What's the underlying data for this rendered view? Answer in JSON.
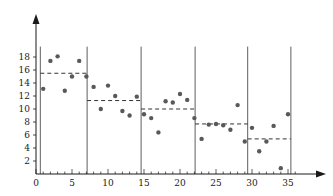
{
  "chart_data": {
    "type": "scatter",
    "title": "",
    "subtitle": "",
    "xlabel": "",
    "ylabel": "",
    "xlim": [
      0,
      36.5
    ],
    "ylim": [
      0,
      19.5
    ],
    "xticks": [
      0,
      5,
      10,
      15,
      20,
      25,
      30,
      35
    ],
    "yticks": [
      2,
      4,
      6,
      8,
      10,
      12,
      14,
      16,
      18
    ],
    "xticklabels": [
      "0",
      "5",
      "10",
      "15",
      "20",
      "25",
      "30",
      "35"
    ],
    "yticklabels": [
      "2",
      "4",
      "6",
      "8",
      "10",
      "12",
      "14",
      "16",
      "18"
    ],
    "grid": false,
    "legend": null,
    "axis_style": "arrow",
    "marker": {
      "shape": "circle",
      "color": "#595959",
      "size": 2.2
    },
    "point_color": "#595959",
    "segment_line_color": "#333333",
    "boundary_color": "#4d4d4d",
    "axis_color": "#1a1a1a",
    "series": [
      {
        "name": "observations",
        "x": [
          1.0,
          2.0,
          3.0,
          4.0,
          5.0,
          6.0,
          7.0,
          8.0,
          9.0,
          10.0,
          11.0,
          12.0,
          13.0,
          14.0,
          15.0,
          16.0,
          17.0,
          18.0,
          19.0,
          20.0,
          21.0,
          22.0,
          23.0,
          24.0,
          25.0,
          26.0,
          27.0,
          28.0,
          29.0,
          30.0,
          31.0,
          32.0,
          33.0,
          34.0,
          35.0
        ],
        "y": [
          13.1,
          17.4,
          18.1,
          12.8,
          15.0,
          17.4,
          15.0,
          13.4,
          10.0,
          13.6,
          12.0,
          9.7,
          9.0,
          11.9,
          9.2,
          8.6,
          6.4,
          11.2,
          11.0,
          12.3,
          11.4,
          8.6,
          5.4,
          7.6,
          7.7,
          7.5,
          6.8,
          10.6,
          5.0,
          7.1,
          3.5,
          5.0,
          7.4,
          0.9,
          9.2
        ]
      }
    ],
    "segments": [
      {
        "label": "segment-1",
        "x_start": 0.6,
        "x_end": 7.1,
        "mean": 15.5
      },
      {
        "label": "segment-2",
        "x_start": 7.1,
        "x_end": 14.6,
        "mean": 11.3
      },
      {
        "label": "segment-3",
        "x_start": 14.6,
        "x_end": 22.1,
        "mean": 10.0
      },
      {
        "label": "segment-4",
        "x_start": 22.1,
        "x_end": 29.4,
        "mean": 7.7
      },
      {
        "label": "segment-5",
        "x_start": 29.4,
        "x_end": 35.4,
        "mean": 5.4
      }
    ],
    "boundaries": [
      0.6,
      7.1,
      14.6,
      22.1,
      29.4,
      35.4
    ],
    "boundary_y_top": 19.6,
    "boundary_y_bottom": 0.0
  }
}
